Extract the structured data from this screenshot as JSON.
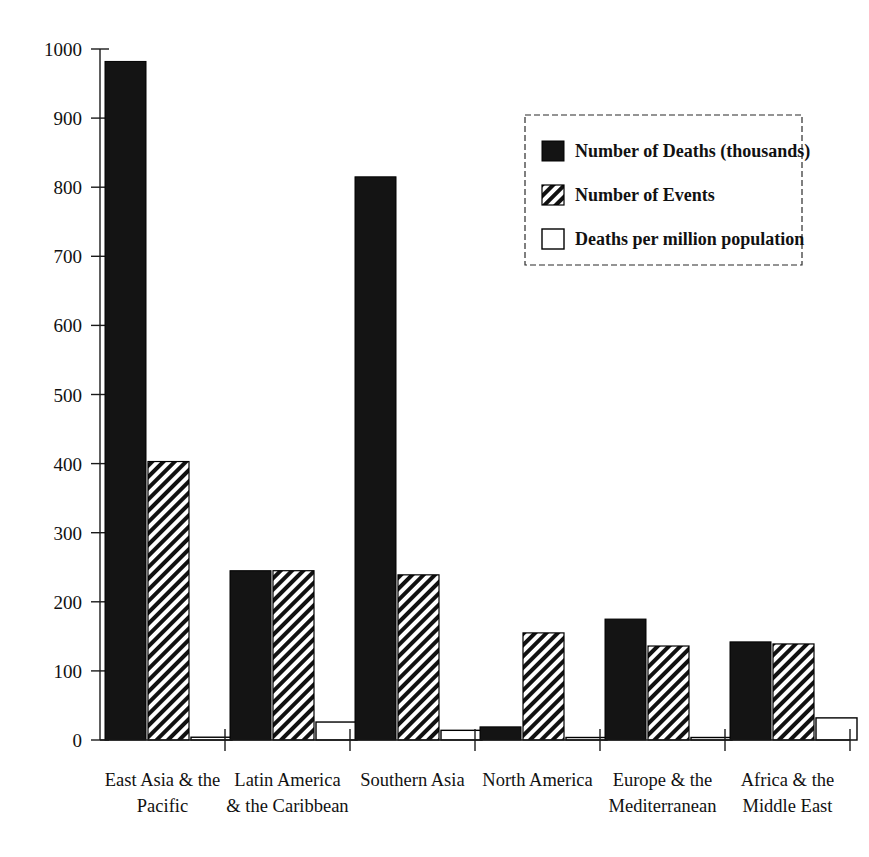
{
  "chart_data": {
    "type": "bar",
    "title": "",
    "subtitle": "",
    "xlabel": "",
    "ylabel": "",
    "ylim": [
      0,
      1000
    ],
    "ytick_step": 100,
    "grid": false,
    "legend_position": "top-right",
    "orientation": "vertical",
    "grouping": "grouped",
    "categories": [
      "East Asia & the Pacific",
      "Latin America & the Caribbean",
      "Southern Asia",
      "North America",
      "Europe & the Mediterranean",
      "Africa & the Middle East"
    ],
    "category_lines": [
      [
        "East Asia & the",
        "Pacific"
      ],
      [
        "Latin America",
        "& the Caribbean"
      ],
      [
        "Southern Asia",
        ""
      ],
      [
        "North America",
        ""
      ],
      [
        "Europe & the",
        "Mediterranean"
      ],
      [
        "Africa & the",
        "Middle East"
      ]
    ],
    "ytick_labels": [
      "0",
      "100",
      "200",
      "300",
      "400",
      "500",
      "600",
      "700",
      "800",
      "900",
      "1000"
    ],
    "ytick_values": [
      0,
      100,
      200,
      300,
      400,
      500,
      600,
      700,
      800,
      900,
      1000
    ],
    "series": [
      {
        "name": "Number of Deaths (thousands)",
        "style": "solid-black",
        "color": "#141414",
        "values": [
          982,
          245,
          815,
          19,
          175,
          142
        ]
      },
      {
        "name": "Number of Events",
        "style": "diagonal-hatch",
        "color": "#000000",
        "values": [
          403,
          245,
          239,
          155,
          136,
          139
        ]
      },
      {
        "name": "Deaths per million population",
        "style": "open-white",
        "color": "#ffffff",
        "values": [
          4,
          26,
          14,
          3,
          3,
          32
        ]
      }
    ]
  },
  "legend": {
    "entries": [
      "Number of Deaths (thousands)",
      "Number of Events",
      "Deaths per million population"
    ]
  }
}
